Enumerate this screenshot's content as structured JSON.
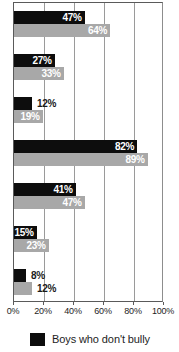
{
  "chart_data": {
    "type": "bar",
    "orientation": "horizontal",
    "title": "",
    "xlabel": "",
    "ylabel": "",
    "xlim": [
      0,
      100
    ],
    "xticks": [
      "0%",
      "20%",
      "40%",
      "60%",
      "80%",
      "100%"
    ],
    "xtick_values": [
      0,
      20,
      40,
      60,
      80,
      100
    ],
    "grid": true,
    "legend_position": "bottom-left",
    "categories": [
      "",
      "",
      "",
      "",
      "",
      "",
      ""
    ],
    "series": [
      {
        "name": "Boys who don't bully",
        "color": "#0d0d0d",
        "values": [
          47,
          27,
          12,
          82,
          41,
          15,
          8
        ],
        "labels": [
          "47%",
          "27%",
          "12%",
          "82%",
          "41%",
          "15%",
          "8%"
        ],
        "label_inside": [
          true,
          true,
          false,
          true,
          true,
          true,
          false
        ]
      },
      {
        "name": "",
        "color": "#a8a8a8",
        "values": [
          64,
          33,
          19,
          89,
          47,
          23,
          12
        ],
        "labels": [
          "64%",
          "33%",
          "19%",
          "89%",
          "47%",
          "23%",
          "12%"
        ],
        "label_inside": [
          true,
          true,
          true,
          true,
          true,
          true,
          false
        ]
      }
    ]
  },
  "axis": {
    "ticks": [
      {
        "label": "0%",
        "value": 0
      },
      {
        "label": "20%",
        "value": 20
      },
      {
        "label": "40%",
        "value": 40
      },
      {
        "label": "60%",
        "value": 60
      },
      {
        "label": "80%",
        "value": 80
      },
      {
        "label": "100%",
        "value": 100
      }
    ]
  },
  "legend": {
    "items": [
      {
        "label": "Boys who don't bully",
        "color": "#0d0d0d"
      }
    ]
  },
  "colors": {
    "dark_series": "#0d0d0d",
    "light_series": "#a8a8a8",
    "gridline": "#9a9a9a",
    "axis": "#5a5a5a",
    "background": "#ffffff",
    "text": "#1d1d1d"
  }
}
